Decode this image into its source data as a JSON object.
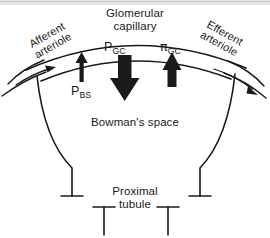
{
  "figure": {
    "background_color": "#ffffff",
    "ink_color": "#1a1a1a"
  },
  "labels": {
    "capillary_line1": "Glomerular",
    "capillary_line2": "capillary",
    "afferent_line1": "Afferent",
    "afferent_line2": "arteriole",
    "efferent_line1": "Efferent",
    "efferent_line2": "arteriole",
    "p_gc_symbol": "P",
    "p_gc_subscript": "GC",
    "pi_gc_symbol": "π",
    "pi_gc_subscript": "GC",
    "p_bs_symbol": "P",
    "p_bs_subscript": "BS",
    "bowmans_space": "Bowman's space",
    "proximal_line1": "Proximal",
    "proximal_line2": "tubule"
  },
  "arrows": {
    "p_gc_direction": "down",
    "p_gc_weight": "thick",
    "pi_gc_direction": "up",
    "pi_gc_weight": "medium",
    "p_bs_direction": "up",
    "p_bs_weight": "thin",
    "afferent_flow_direction": "right",
    "efferent_flow_direction": "down-right"
  },
  "scan_artifact": {
    "top_edge_color": "#c9c9c9"
  }
}
